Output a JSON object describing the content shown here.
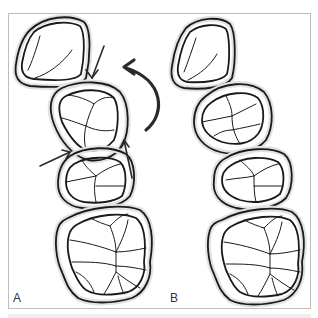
{
  "figure": {
    "panels": [
      {
        "label": "A",
        "description": "Teeth with arrows indicating rotation/movement"
      },
      {
        "label": "B",
        "description": "Teeth after correction"
      }
    ],
    "annotations": {
      "arrows": [
        "arrow-down-toward-second-tooth",
        "arrow-up-right-toward-contact",
        "arrow-up-on-third-tooth",
        "curved-rotation-arrow"
      ]
    },
    "colors": {
      "outline": "#1a1a1a",
      "halo": "#e2e2e2",
      "frame": "#bdbdbd",
      "arrow": "#2a2a2a"
    }
  }
}
